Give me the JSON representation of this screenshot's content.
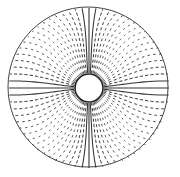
{
  "diagram": {
    "type": "annular-vector-field",
    "width": 180,
    "height": 177,
    "center": [
      88,
      87
    ],
    "outer_radius": 80,
    "inner_radius": 14,
    "line_count": 72,
    "colors": {
      "background": "#ffffff",
      "stroke": "#333333",
      "outer_circle": "#444444",
      "inner_circle": "#222222"
    },
    "pattern": "lines solid and radial near horizontal/vertical axes; dashed and curved near diagonals"
  }
}
